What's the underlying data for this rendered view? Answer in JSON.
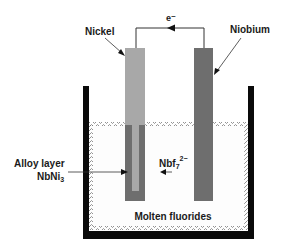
{
  "diagram": {
    "labels": {
      "electron": "e⁻",
      "nickel": "Nickel",
      "niobium": "Niobium",
      "alloy_line1": "Alloy layer",
      "alloy_line2_base": "NbNi",
      "alloy_line2_sub": "3",
      "ion_base": "Nbf",
      "ion_sub": "7",
      "ion_sup": "2−",
      "melt": "Molten fluorides"
    },
    "colors": {
      "nickel": "#a8a8a8",
      "niobium": "#6e6e6e",
      "alloy": "#6e6e6e",
      "container": "#0a0a0a",
      "wire": "#333333",
      "text": "#1a1a1a"
    }
  }
}
